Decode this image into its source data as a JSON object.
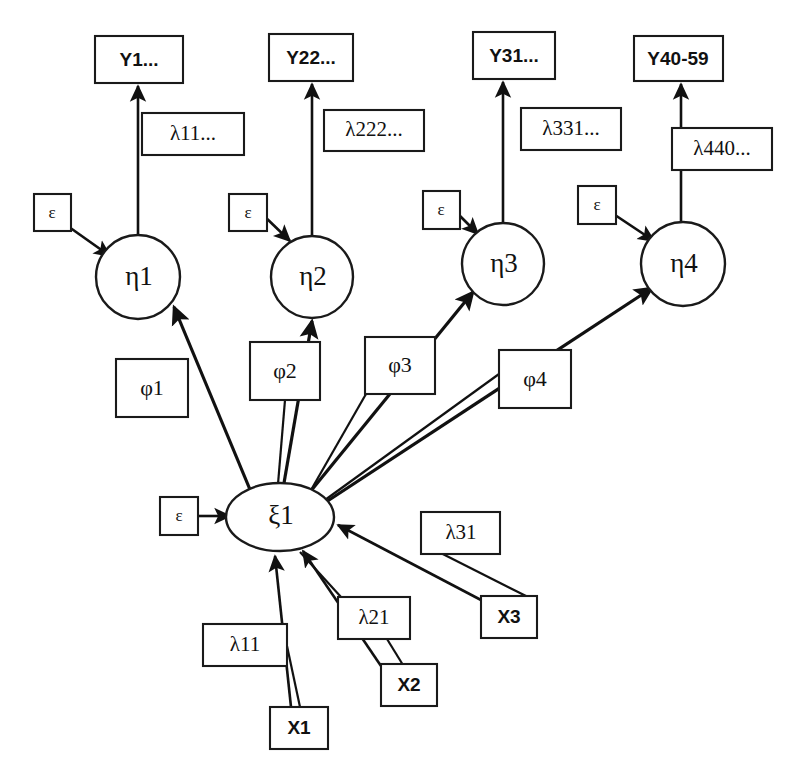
{
  "diagram": {
    "type": "path-diagram",
    "background_color": "#ffffff",
    "line_color": "#111111",
    "shape_fill": "#ffffff"
  },
  "indicators_y": [
    {
      "id": "y1",
      "label": "Y1...",
      "x": 95,
      "y": 36,
      "w": 88,
      "h": 47
    },
    {
      "id": "y22",
      "label": "Y22...",
      "x": 269,
      "y": 34,
      "w": 84,
      "h": 47
    },
    {
      "id": "y31",
      "label": "Y31...",
      "x": 473,
      "y": 32,
      "w": 82,
      "h": 47
    },
    {
      "id": "y40",
      "label": "Y40-59",
      "x": 634,
      "y": 36,
      "w": 89,
      "h": 45
    }
  ],
  "loadings_y": [
    {
      "id": "lam11d",
      "label": "λ11...",
      "x": 142,
      "y": 113,
      "w": 102,
      "h": 42
    },
    {
      "id": "lam222d",
      "label": "λ222...",
      "x": 324,
      "y": 110,
      "w": 100,
      "h": 41
    },
    {
      "id": "lam331d",
      "label": "λ331...",
      "x": 521,
      "y": 108,
      "w": 100,
      "h": 42
    },
    {
      "id": "lam440d",
      "label": "λ440...",
      "x": 672,
      "y": 128,
      "w": 100,
      "h": 42
    }
  ],
  "errors_eta": [
    {
      "id": "eps1",
      "label": "ε",
      "x": 34,
      "y": 194,
      "w": 37,
      "h": 37
    },
    {
      "id": "eps2",
      "label": "ε",
      "x": 229,
      "y": 194,
      "w": 38,
      "h": 37
    },
    {
      "id": "eps3",
      "label": "ε",
      "x": 423,
      "y": 191,
      "w": 37,
      "h": 38
    },
    {
      "id": "eps4",
      "label": "ε",
      "x": 578,
      "y": 186,
      "w": 38,
      "h": 38
    }
  ],
  "latents_eta": [
    {
      "id": "eta1",
      "label": "η1",
      "cx": 138,
      "cy": 277,
      "r": 42
    },
    {
      "id": "eta2",
      "label": "η2",
      "cx": 312,
      "cy": 277,
      "r": 41
    },
    {
      "id": "eta3",
      "label": "η3",
      "cx": 503,
      "cy": 264,
      "r": 41
    },
    {
      "id": "eta4",
      "label": "η4",
      "cx": 683,
      "cy": 264,
      "r": 42
    }
  ],
  "paths_phi": [
    {
      "id": "phi1",
      "label": "φ1",
      "x": 116,
      "y": 359,
      "w": 72,
      "h": 58
    },
    {
      "id": "phi2",
      "label": "φ2",
      "x": 250,
      "y": 342,
      "w": 70,
      "h": 58
    },
    {
      "id": "phi3",
      "label": "φ3",
      "x": 365,
      "y": 337,
      "w": 70,
      "h": 57
    },
    {
      "id": "phi4",
      "label": "φ4",
      "x": 499,
      "y": 350,
      "w": 72,
      "h": 58
    }
  ],
  "latent_xi": {
    "id": "xi1",
    "label": "ξ1",
    "cx": 280,
    "cy": 517,
    "rx": 54,
    "ry": 34
  },
  "error_xi": {
    "id": "eps5",
    "label": "ε",
    "x": 160,
    "y": 497,
    "w": 38,
    "h": 38
  },
  "loadings_x": [
    {
      "id": "lam11",
      "label": "λ11",
      "x": 203,
      "y": 624,
      "w": 84,
      "h": 42
    },
    {
      "id": "lam21",
      "label": "λ21",
      "x": 338,
      "y": 597,
      "w": 72,
      "h": 42
    },
    {
      "id": "lam31",
      "label": "λ31",
      "x": 421,
      "y": 512,
      "w": 79,
      "h": 42
    }
  ],
  "indicators_x": [
    {
      "id": "x1",
      "label": "X1",
      "x": 270,
      "y": 707,
      "w": 58,
      "h": 42
    },
    {
      "id": "x2",
      "label": "X2",
      "x": 381,
      "y": 664,
      "w": 56,
      "h": 42
    },
    {
      "id": "x3",
      "label": "X3",
      "x": 481,
      "y": 596,
      "w": 56,
      "h": 42
    }
  ],
  "edges": {
    "eta_to_y": [
      {
        "id": "eta1-y1",
        "from": "eta1",
        "to": "y1"
      },
      {
        "id": "eta2-y22",
        "from": "eta2",
        "to": "y22"
      },
      {
        "id": "eta3-y31",
        "from": "eta3",
        "to": "y31"
      },
      {
        "id": "eta4-y40",
        "from": "eta4",
        "to": "y40"
      }
    ],
    "eps_to_eta": [
      {
        "id": "eps1-eta1",
        "from": "eps1",
        "to": "eta1"
      },
      {
        "id": "eps2-eta2",
        "from": "eps2",
        "to": "eta2"
      },
      {
        "id": "eps3-eta3",
        "from": "eps3",
        "to": "eta3"
      },
      {
        "id": "eps4-eta4",
        "from": "eps4",
        "to": "eta4"
      }
    ],
    "xi_to_eta": [
      {
        "id": "xi1-eta1",
        "from": "xi1",
        "to": "eta1"
      },
      {
        "id": "xi1-eta2",
        "from": "xi1",
        "to": "eta2"
      },
      {
        "id": "xi1-eta3",
        "from": "xi1",
        "to": "eta3"
      },
      {
        "id": "xi1-eta4",
        "from": "xi1",
        "to": "eta4"
      }
    ],
    "x_to_xi": [
      {
        "id": "x1-xi1",
        "from": "x1",
        "to": "xi1"
      },
      {
        "id": "x2-xi1",
        "from": "x2",
        "to": "xi1"
      },
      {
        "id": "x3-xi1",
        "from": "x3",
        "to": "xi1"
      }
    ],
    "eps_to_xi": [
      {
        "id": "eps5-xi1",
        "from": "eps5",
        "to": "xi1"
      }
    ]
  }
}
